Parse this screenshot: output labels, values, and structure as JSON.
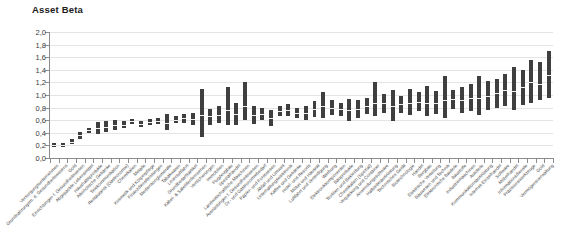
{
  "chart_data": {
    "type": "bar",
    "title": "Asset Beta",
    "subtitle": "",
    "xlabel": "",
    "ylabel": "",
    "ylim": [
      0.0,
      2.0
    ],
    "ytick_step": 0.2,
    "decimal_separator": ",",
    "grid": true,
    "legend": "none",
    "bar_style": "range-bar-with-median",
    "series_note": "Each bar spans the min-max asset beta range of the sector; the white line marks the median.",
    "ytick_labels": [
      "2,0",
      "1,8",
      "1,6",
      "1,4",
      "1,2",
      "1,0",
      "0,8",
      "0,6",
      "0,4",
      "0,2",
      "0,0"
    ],
    "ytick_values": [
      2.0,
      1.8,
      1.6,
      1.4,
      1.2,
      1.0,
      0.8,
      0.6,
      0.4,
      0.2,
      0.0
    ],
    "categories": [
      "Versorgungsunternehmen",
      "Grundnahrungsm. d. Gesundheitswesens",
      "Gold",
      "Einrichtungen f. Gesundheitswesen",
      "Abgepackte Lebensmittel",
      "Haushaltsprodukte",
      "Alkoholische Getränke",
      "Telekommunikation",
      "Restaurants (Gastronomie)",
      "Chemikalien",
      "Metalle",
      "Kosmetik und Körperpflege",
      "Finanzdienstleistungen",
      "Medienkonglomerate",
      "Tabakwaren",
      "Linienluftfahrt",
      "Grundbedarfsartikel",
      "Kabel- & Satellitenfernsehen",
      "Versicherungen",
      "Immobilien",
      "Flugzeugbau",
      "Spezialhandel",
      "Landwirtschaftliche Maschinen",
      "Ausrüstungen f. Gesundheitswesen",
      "Dr.- und Gastronomiebedarf",
      "Papier- und Forstwesen",
      "Abfall und Umwelt",
      "Unterhaltungselektronik",
      "Kaffee und Getränke",
      "Hotel- und Resorts",
      "Möbel und Hausrat",
      "Luftfahrt und Verteidigung",
      "Werbung",
      "Elektronikkomponenten",
      "Bauprodukte",
      "Textilien und Bekleidung",
      "Chemikalien (Spezial)",
      "Verpackung und Container",
      "Anwendungssoftware",
      "Halbleiterausrüstung",
      "Technisches Gerät",
      "Biotechnologie",
      "Handel",
      "Bergbau",
      "Elektrische Verteilung",
      "Bauwesen und Technik",
      "Elektronische Bauteile",
      "Baustoffe",
      "Industriemaschinen",
      "Autoteile",
      "Kommunikationsausrüstung",
      "Internet-Einzelhandel",
      "Software",
      "Möbelhandel",
      "Informationsdienste",
      "Präzisionswerkzeuge",
      "Gold",
      "Vermögensverwaltung"
    ],
    "low": [
      0.18,
      0.18,
      0.22,
      0.3,
      0.39,
      0.38,
      0.41,
      0.44,
      0.48,
      0.54,
      0.49,
      0.52,
      0.54,
      0.44,
      0.56,
      0.56,
      0.52,
      0.34,
      0.53,
      0.55,
      0.52,
      0.53,
      0.61,
      0.54,
      0.6,
      0.5,
      0.66,
      0.66,
      0.64,
      0.6,
      0.65,
      0.64,
      0.68,
      0.66,
      0.58,
      0.63,
      0.7,
      0.66,
      0.72,
      0.58,
      0.72,
      0.68,
      0.74,
      0.66,
      0.7,
      0.64,
      0.78,
      0.72,
      0.74,
      0.68,
      0.76,
      0.8,
      0.82,
      0.76,
      0.84,
      0.88,
      0.92,
      0.96
    ],
    "high": [
      0.24,
      0.24,
      0.3,
      0.42,
      0.48,
      0.57,
      0.58,
      0.6,
      0.58,
      0.62,
      0.58,
      0.62,
      0.63,
      0.7,
      0.66,
      0.7,
      0.72,
      1.09,
      0.78,
      0.83,
      1.12,
      0.88,
      1.21,
      0.82,
      0.8,
      0.76,
      0.82,
      0.86,
      0.8,
      0.82,
      0.9,
      1.05,
      0.92,
      0.88,
      0.94,
      0.92,
      0.96,
      1.2,
      1.02,
      1.08,
      0.98,
      1.1,
      1.04,
      1.14,
      1.06,
      1.3,
      1.08,
      1.12,
      1.18,
      1.3,
      1.22,
      1.26,
      1.34,
      1.44,
      1.4,
      1.56,
      1.52,
      1.7
    ],
    "median": [
      0.21,
      0.21,
      0.26,
      0.36,
      0.44,
      0.47,
      0.5,
      0.52,
      0.53,
      0.58,
      0.54,
      0.57,
      0.58,
      0.56,
      0.61,
      0.63,
      0.62,
      0.68,
      0.66,
      0.69,
      0.76,
      0.7,
      0.82,
      0.68,
      0.7,
      0.64,
      0.74,
      0.76,
      0.72,
      0.71,
      0.77,
      0.82,
      0.8,
      0.77,
      0.76,
      0.78,
      0.83,
      0.88,
      0.87,
      0.82,
      0.85,
      0.88,
      0.89,
      0.88,
      0.88,
      0.92,
      0.93,
      0.92,
      0.96,
      0.95,
      0.99,
      1.03,
      1.08,
      1.06,
      1.12,
      1.2,
      1.18,
      1.32
    ]
  },
  "colors": {
    "bar": "#3f3f3f",
    "median_line": "#ffffff",
    "grid": "#e4e4e4",
    "axis": "#8c8c8c",
    "title": "#1b1b1b",
    "tick_label": "#3a3a3a",
    "category_label": "#4a4a4a",
    "background": "#ffffff"
  }
}
